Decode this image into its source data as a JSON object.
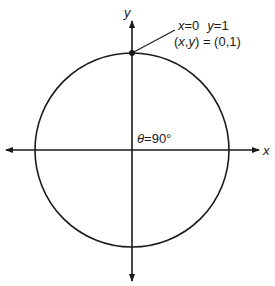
{
  "diagram": {
    "type": "unit-circle",
    "axes": {
      "x_label": "x",
      "y_label": "y"
    },
    "point": {
      "line1_x": "x",
      "line1_x_eq": "=0",
      "line1_y": "y",
      "line1_y_eq": "=1",
      "line2": "(x,y) = (0,1)",
      "line2_open": "(",
      "line2_x": "x",
      "line2_comma": ",",
      "line2_y": "y",
      "line2_rest": ") = (0,1)"
    },
    "angle": {
      "theta": "θ",
      "value": "=90°"
    },
    "colors": {
      "stroke": "#1a1a1a",
      "background": "#ffffff"
    }
  }
}
